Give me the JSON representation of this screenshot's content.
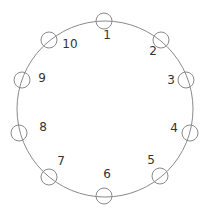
{
  "diagram": {
    "type": "ring",
    "colors": {
      "stroke": "#8a8a8a",
      "text": "#333333",
      "background": "#ffffff"
    },
    "ring": {
      "cx": 105,
      "cy": 109,
      "r": 88
    },
    "node_radius": 8,
    "nodes": [
      {
        "id": 1,
        "label": "1",
        "cx": 104,
        "cy": 21,
        "lx": 107,
        "ly": 35
      },
      {
        "id": 2,
        "label": "2",
        "cx": 161,
        "cy": 40,
        "lx": 153,
        "ly": 51
      },
      {
        "id": 3,
        "label": "3",
        "cx": 186,
        "cy": 80,
        "lx": 171,
        "ly": 80
      },
      {
        "id": 4,
        "label": "4",
        "cx": 190,
        "cy": 133,
        "lx": 174,
        "ly": 128
      },
      {
        "id": 5,
        "label": "5",
        "cx": 160,
        "cy": 176,
        "lx": 151,
        "ly": 160
      },
      {
        "id": 6,
        "label": "6",
        "cx": 104,
        "cy": 196,
        "lx": 107,
        "ly": 174
      },
      {
        "id": 7,
        "label": "7",
        "cx": 49,
        "cy": 177,
        "lx": 61,
        "ly": 161
      },
      {
        "id": 8,
        "label": "8",
        "cx": 19,
        "cy": 133,
        "lx": 43,
        "ly": 127
      },
      {
        "id": 9,
        "label": "9",
        "cx": 22,
        "cy": 80,
        "lx": 42,
        "ly": 78
      },
      {
        "id": 10,
        "label": "10",
        "cx": 49,
        "cy": 40,
        "lx": 70,
        "ly": 44
      }
    ]
  }
}
